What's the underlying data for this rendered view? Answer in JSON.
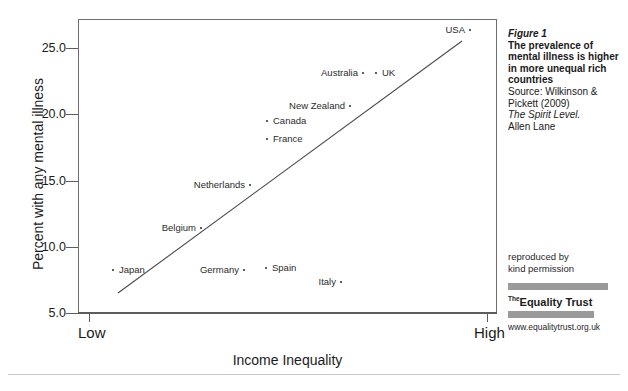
{
  "chart_data": {
    "type": "scatter",
    "title": "",
    "xlabel": "Income Inequality",
    "ylabel": "Percent with any mental illness",
    "x_tick_labels": [
      "Low",
      "High"
    ],
    "y_tick_labels": [
      "5.0",
      "10.0",
      "15.0",
      "20.0",
      "25.0"
    ],
    "y_ticks": [
      5.0,
      10.0,
      15.0,
      20.0,
      25.0
    ],
    "ylim": [
      3.9,
      26.9
    ],
    "xlim": [
      0,
      100
    ],
    "grid": false,
    "legend": "none",
    "points": [
      {
        "label": "Japan",
        "x": 8.4,
        "y": 8.3,
        "px": 113,
        "py": 270,
        "label_side": "right",
        "label_px": 119,
        "label_py": 265
      },
      {
        "label": "Belgium",
        "x": 29.4,
        "y": 11.5,
        "px": 201,
        "py": 228,
        "label_side": "left",
        "label_px": 196,
        "label_py": 223
      },
      {
        "label": "Netherlands",
        "x": 41.1,
        "y": 14.7,
        "px": 250,
        "py": 185,
        "label_side": "left",
        "label_px": 245,
        "label_py": 180
      },
      {
        "label": "Germany",
        "x": 39.6,
        "y": 8.3,
        "px": 244,
        "py": 270,
        "label_side": "left",
        "label_px": 239,
        "label_py": 265
      },
      {
        "label": "Spain",
        "x": 44.9,
        "y": 8.5,
        "px": 266,
        "py": 268,
        "label_side": "right",
        "label_px": 272,
        "label_py": 263
      },
      {
        "label": "France",
        "x": 45.1,
        "y": 18.2,
        "px": 267,
        "py": 139,
        "label_side": "right",
        "label_px": 273,
        "label_py": 134
      },
      {
        "label": "Canada",
        "x": 45.1,
        "y": 19.5,
        "px": 267,
        "py": 121,
        "label_side": "right",
        "label_px": 273,
        "label_py": 116
      },
      {
        "label": "New Zealand",
        "x": 64.9,
        "y": 20.6,
        "px": 350,
        "py": 106,
        "label_side": "left",
        "label_px": 345,
        "label_py": 101
      },
      {
        "label": "Australia",
        "x": 68.0,
        "y": 23.1,
        "px": 363,
        "py": 73,
        "label_side": "left",
        "label_px": 358,
        "label_py": 68
      },
      {
        "label": "UK",
        "x": 71.1,
        "y": 23.1,
        "px": 376,
        "py": 73,
        "label_side": "right",
        "label_px": 382,
        "label_py": 68
      },
      {
        "label": "Italy",
        "x": 62.8,
        "y": 7.4,
        "px": 341,
        "py": 282,
        "label_side": "left",
        "label_px": 336,
        "label_py": 277
      },
      {
        "label": "USA",
        "x": 93.6,
        "y": 26.6,
        "px": 470,
        "py": 30,
        "label_side": "left",
        "label_px": 465,
        "label_py": 25
      }
    ],
    "trendline": {
      "x1_px": 118,
      "y1_px": 293,
      "x2_px": 462,
      "y2_px": 41,
      "description": "positive linear fit"
    }
  },
  "caption": {
    "figure_number": "Figure 1",
    "headline": "The prevalence of mental illness is higher in more unequal rich countries",
    "source": "Source: Wilkinson & Pickett (2009)",
    "book_title": "The Spirit Level.",
    "publisher": "Allen Lane"
  },
  "permission": {
    "line1": "reproduced by",
    "line2": "kind permission"
  },
  "logo": {
    "the": "The",
    "name": "Equality Trust",
    "url": "www.equalitytrust.org.uk"
  },
  "colors": {
    "axis": "#5c5c5c",
    "frame": "#6f6f6f",
    "point": "#2a2a2a",
    "trendline": "#4a4a4a",
    "logo_bar": "#9a9a9a",
    "text": "#1b1b1b",
    "rule": "#c8c8c8"
  }
}
